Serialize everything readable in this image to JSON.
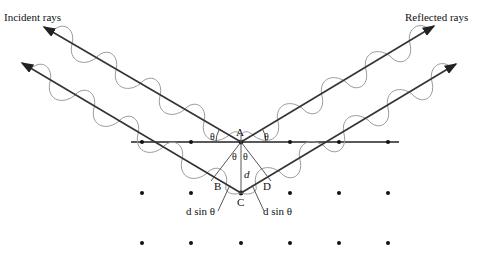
{
  "labels": {
    "incident": "Incident rays",
    "reflected": "Reflected rays",
    "point_a": "A",
    "point_b": "B",
    "point_c": "C",
    "point_d": "D",
    "spacing": "d",
    "theta": "θ",
    "path_left": "d sin θ",
    "path_right": "d sin θ"
  },
  "colors": {
    "ray": "#333333",
    "wave": "#9a9a9a",
    "atom": "#111111"
  },
  "lattice": {
    "columns_x": [
      142,
      191,
      241,
      290,
      339,
      388
    ],
    "rows_y": [
      142,
      193,
      243
    ]
  }
}
